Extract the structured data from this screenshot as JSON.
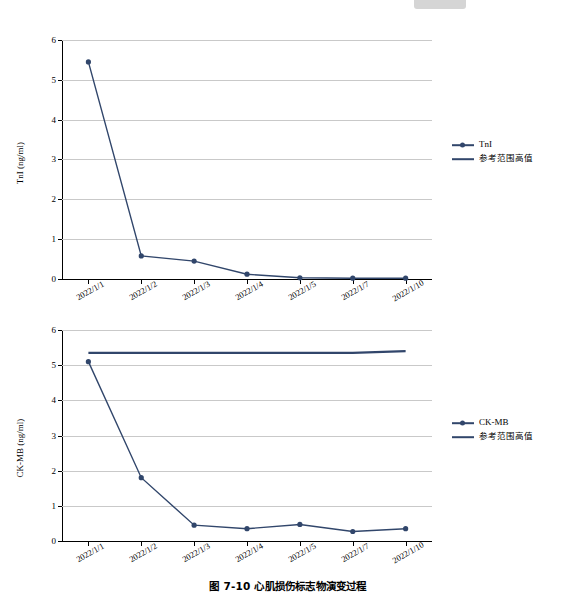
{
  "top_tab": {
    "name": "grey-tab"
  },
  "caption": "图 7-10  心肌损伤标志物演变过程",
  "charts": [
    {
      "id": "chart1",
      "ylabel": "TnI (ng/ml)",
      "legend": [
        {
          "label": "TnI",
          "type": "line-marker",
          "color": "#31466b"
        },
        {
          "label": "参考范围高值",
          "type": "line",
          "color": "#31466b"
        }
      ],
      "chart_data": {
        "type": "line",
        "title": "",
        "xlabel": "",
        "ylabel": "TnI (ng/ml)",
        "categories": [
          "2022/1/1",
          "2022/1/2",
          "2022/1/3",
          "2022/1/4",
          "2022/1/5",
          "2022/1/7",
          "2022/1/10"
        ],
        "yticks": [
          0,
          1,
          2,
          3,
          4,
          5,
          6
        ],
        "ylim": [
          0,
          6
        ],
        "grid": true,
        "legend_position": "right",
        "series": [
          {
            "name": "TnI",
            "values": [
              5.45,
              0.58,
              0.45,
              0.12,
              0.03,
              0.02,
              0.02
            ],
            "marker": true
          },
          {
            "name": "参考范围高值",
            "values": [
              null,
              null,
              null,
              null,
              null,
              null,
              null
            ],
            "marker": false
          }
        ]
      }
    },
    {
      "id": "chart2",
      "ylabel": "CK-MB (ng/ml)",
      "legend": [
        {
          "label": "CK-MB",
          "type": "line-marker",
          "color": "#31466b"
        },
        {
          "label": "参考范围高值",
          "type": "line",
          "color": "#31466b"
        }
      ],
      "chart_data": {
        "type": "line",
        "title": "",
        "xlabel": "",
        "ylabel": "CK-MB (ng/ml)",
        "categories": [
          "2022/1/1",
          "2022/1/2",
          "2022/1/3",
          "2022/1/4",
          "2022/1/5",
          "2022/1/7",
          "2022/1/10"
        ],
        "yticks": [
          0,
          1,
          2,
          3,
          4,
          5,
          6
        ],
        "ylim": [
          0,
          6
        ],
        "grid": true,
        "legend_position": "right",
        "series": [
          {
            "name": "CK-MB",
            "values": [
              5.1,
              1.8,
              0.45,
              0.35,
              0.47,
              0.27,
              0.35
            ],
            "marker": true
          },
          {
            "name": "参考范围高值",
            "values": [
              5.35,
              5.35,
              5.35,
              5.35,
              5.35,
              5.35,
              5.4
            ],
            "marker": false
          }
        ]
      }
    }
  ]
}
